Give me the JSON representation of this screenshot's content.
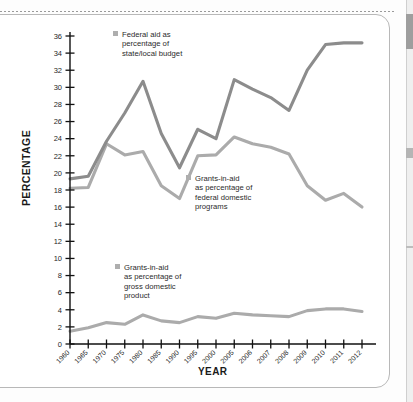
{
  "page": {
    "scrollbar_name": "vertical-scrollbar"
  },
  "chart_data": {
    "type": "line",
    "title": "",
    "xlabel": "YEAR",
    "ylabel": "PERCENTAGE",
    "ylim": [
      0,
      36
    ],
    "ytick_step": 2,
    "yticks": [
      0,
      2,
      4,
      6,
      8,
      10,
      12,
      14,
      16,
      18,
      20,
      22,
      24,
      26,
      28,
      30,
      32,
      34,
      36
    ],
    "grid": false,
    "legend_position": "inline-annotations",
    "categories": [
      "1960",
      "1965",
      "1970",
      "1975",
      "1980",
      "1985",
      "1990",
      "1995",
      "2000",
      "2005",
      "2006",
      "2007",
      "2008",
      "2009",
      "2010",
      "2011",
      "2012"
    ],
    "series": [
      {
        "name": "Federal aid as percentage of state/local budget",
        "color": "#8c8c8c",
        "values": [
          19.3,
          19.6,
          23.7,
          27.0,
          30.7,
          24.6,
          20.6,
          25.1,
          24.0,
          30.9,
          29.8,
          28.8,
          27.3,
          32.0,
          35.0,
          35.2,
          35.2
        ]
      },
      {
        "name": "Grants-in-aid as percentage of federal domestic programs",
        "color": "#ababab",
        "values": [
          18.2,
          18.3,
          23.4,
          22.1,
          22.5,
          18.5,
          17.0,
          22.0,
          22.1,
          24.2,
          23.4,
          23.0,
          22.2,
          18.5,
          16.8,
          17.6,
          16.0
        ]
      },
      {
        "name": "Grants-in-aid as percentage of gross domestic product",
        "color": "#ababab",
        "values": [
          1.5,
          1.9,
          2.5,
          2.3,
          3.4,
          2.7,
          2.5,
          3.2,
          3.0,
          3.6,
          3.4,
          3.3,
          3.2,
          3.9,
          4.1,
          4.1,
          3.8
        ]
      }
    ]
  },
  "legends": {
    "federal": {
      "swatch_color": "#aeaeae",
      "lines": [
        "Federal aid as",
        "percentage of",
        "state/local budget"
      ]
    },
    "domestic": {
      "swatch_color": "#aeaeae",
      "lines": [
        "Grants-in-aid",
        "as percentage of",
        "federal domestic",
        "programs"
      ]
    },
    "gdp": {
      "swatch_color": "#aeaeae",
      "lines": [
        "Grants-in-aid",
        "as percentage of",
        "gross domestic",
        "product"
      ]
    }
  }
}
